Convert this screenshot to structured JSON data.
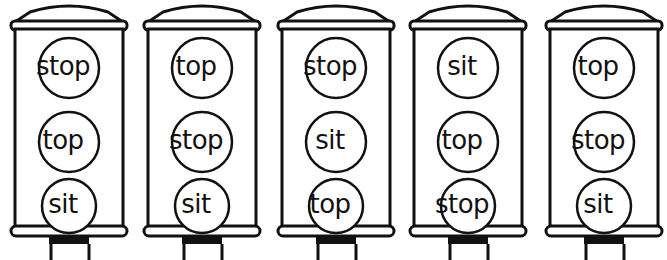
{
  "worksheet": {
    "lights": [
      {
        "words": [
          "stop",
          "top",
          "sit"
        ]
      },
      {
        "words": [
          "top",
          "stop",
          "sit"
        ]
      },
      {
        "words": [
          "stop",
          "sit",
          "top"
        ]
      },
      {
        "words": [
          "sit",
          "top",
          "stop"
        ]
      },
      {
        "words": [
          "top",
          "stop",
          "sit"
        ]
      }
    ]
  },
  "colors": {
    "ink": "#111111",
    "paper": "#ffffff"
  }
}
